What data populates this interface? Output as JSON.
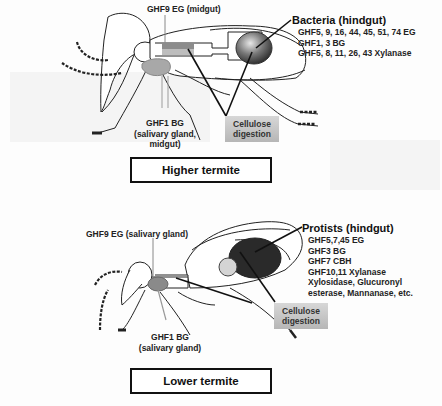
{
  "higher_termite": {
    "title": "Higher termite",
    "labels": {
      "ghf9": "GHF9 EG (midgut)",
      "ghf1_line1": "GHF1 BG",
      "ghf1_line2": "(salivary gland,",
      "ghf1_line3": "midgut)",
      "cellulose_line1": "Cellulose",
      "cellulose_line2": "digestion"
    },
    "symbionts": {
      "heading": "Bacteria (hindgut)",
      "enzymes": [
        "GHF5, 9, 16, 44, 45, 51, 74 EG",
        "GHF1, 3 BG",
        "GHF5, 8, 11, 26, 43 Xylanase"
      ]
    }
  },
  "lower_termite": {
    "title": "Lower termite",
    "labels": {
      "ghf9": "GHF9 EG (salivary gland)",
      "ghf1_line1": "GHF1 BG",
      "ghf1_line2": "(salivary gland)",
      "cellulose_line1": "Cellulose",
      "cellulose_line2": "digestion"
    },
    "symbionts": {
      "heading": "Protists (hindgut)",
      "enzymes": [
        "GHF5,7,45 EG",
        "GHF3 BG",
        "GHF7 CBH",
        "GHF10,11 Xylanase",
        "Xylosidase, Glucuronyl",
        "esterase, Mannanase, etc."
      ]
    }
  },
  "colors": {
    "outline": "#222222",
    "midgut_bar": "#9a9a9a",
    "salivary_gland": "#a8a8a8",
    "bacteria_hindgut": "#555555",
    "protist_hindgut": "#2a2a2a",
    "label_box": "#c4c4c4"
  }
}
